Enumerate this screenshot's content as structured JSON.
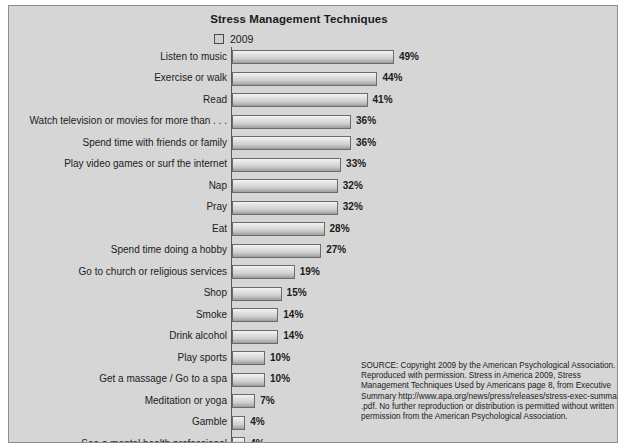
{
  "chart_data": {
    "type": "bar",
    "orientation": "horizontal",
    "title": "Stress Management Techniques",
    "xlabel": "",
    "ylabel": "",
    "grid": false,
    "legend_position": "top",
    "legend": [
      "2009"
    ],
    "xlim": [
      0,
      49
    ],
    "value_suffix": "%",
    "categories": [
      "Listen to music",
      "Exercise or walk",
      "Read",
      "Watch television or movies for more than . . .",
      "Spend time with friends or family",
      "Play video games or surf the internet",
      "Nap",
      "Pray",
      "Eat",
      "Spend time doing a hobby",
      "Go to church or religious services",
      "Shop",
      "Smoke",
      "Drink alcohol",
      "Play sports",
      "Get a massage / Go to a spa",
      "Meditation or yoga",
      "Gamble",
      "See a mental health professional"
    ],
    "values": [
      49,
      44,
      41,
      36,
      36,
      33,
      32,
      32,
      28,
      27,
      19,
      15,
      14,
      14,
      10,
      10,
      7,
      4,
      4
    ],
    "data_labels": [
      "49%",
      "44%",
      "41%",
      "36%",
      "36%",
      "33%",
      "32%",
      "32%",
      "28%",
      "27%",
      "19%",
      "15%",
      "14%",
      "14%",
      "10%",
      "10%",
      "7%",
      "4%",
      "4%"
    ],
    "series": [
      {
        "name": "2009",
        "values": [
          49,
          44,
          41,
          36,
          36,
          33,
          32,
          32,
          28,
          27,
          19,
          15,
          14,
          14,
          10,
          10,
          7,
          4,
          4
        ]
      }
    ],
    "colors": {
      "panel_background": "#d6d6d6",
      "bar_fill_light": "#f3f3f3",
      "bar_fill_dark": "#9b9b9b",
      "bar_border": "#6b6b6b",
      "text": "#1b1b1b",
      "axis": "#5a5a5a"
    }
  },
  "legend": {
    "swatch_name": "legend-swatch-2009",
    "label": "2009"
  },
  "source": {
    "lines": [
      "SOURCE: Copyright 2009 by the American Psychological Association.",
      "Reproduced with permission. Stress in America 2009, Stress",
      "Management Techniques Used by Americans page 8, from Executive",
      "Summary http://www.apa.org/news/press/releases/stress-exec-summary",
      ".pdf. No further reproduction or distribution is permitted without written",
      "permission from the American Psychological Association."
    ]
  }
}
